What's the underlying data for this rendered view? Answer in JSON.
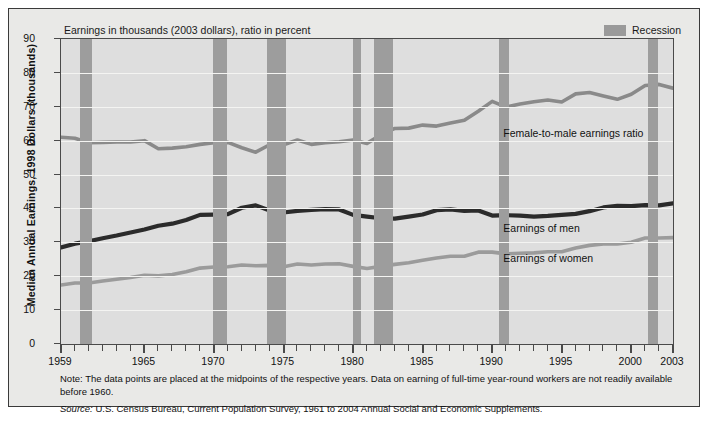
{
  "figure": {
    "units_caption": "Earnings in thousands (2003 dollars), ratio in percent",
    "y_axis_title": "Median Annual Earnings, 1998 Dollars (thousands)",
    "legend": {
      "swatch_name": "recession-swatch",
      "label": "Recession",
      "color": "#9d9d9d"
    },
    "notes": {
      "note": "Note: The data points are placed at the midpoints of the respective years. Data on earning of full-time year-round workers are not readily available before 1960.",
      "source_word": "Source:",
      "source_text": " U.S. Census Bureau, Current Population Survey, 1961 to 2004 Annual Social and Economic Supplements."
    }
  },
  "chart_data": {
    "type": "line",
    "title": "Earnings in thousands (2003 dollars), ratio in percent",
    "xlabel": "",
    "ylabel": "Median Annual Earnings, 1998 Dollars (thousands)",
    "xlim": [
      1959,
      2003
    ],
    "ylim": [
      0,
      90
    ],
    "yticks": [
      0,
      10,
      20,
      30,
      40,
      50,
      60,
      70,
      80,
      90
    ],
    "xticks": [
      1959,
      1965,
      1970,
      1975,
      1980,
      1985,
      1990,
      1995,
      2000,
      2003
    ],
    "grid": "horizontal",
    "legend_position": "top-right",
    "x": [
      1959,
      1960,
      1961,
      1962,
      1963,
      1964,
      1965,
      1966,
      1967,
      1968,
      1969,
      1970,
      1971,
      1972,
      1973,
      1974,
      1975,
      1976,
      1977,
      1978,
      1979,
      1980,
      1981,
      1982,
      1983,
      1984,
      1985,
      1986,
      1987,
      1988,
      1989,
      1990,
      1991,
      1992,
      1993,
      1994,
      1995,
      1996,
      1997,
      1998,
      1999,
      2000,
      2001,
      2002,
      2003
    ],
    "series": [
      {
        "name": "Female-to-male earnings ratio",
        "color": "#8a8a8a",
        "annotation": "Female-to-male earnings ratio",
        "unit": "percent",
        "values": [
          61.0,
          60.7,
          59.4,
          59.5,
          59.6,
          59.6,
          60.0,
          57.6,
          57.8,
          58.2,
          58.9,
          59.4,
          59.5,
          57.9,
          56.6,
          58.8,
          58.8,
          60.2,
          58.9,
          59.4,
          59.7,
          60.2,
          59.2,
          61.7,
          63.6,
          63.7,
          64.6,
          64.3,
          65.2,
          66.0,
          68.7,
          71.6,
          69.9,
          70.8,
          71.5,
          72.0,
          71.4,
          73.8,
          74.2,
          73.2,
          72.2,
          73.7,
          76.3,
          76.6,
          75.5
        ]
      },
      {
        "name": "Earnings of men",
        "color": "#2b2b2b",
        "annotation": "Earnings of men",
        "unit": "thousands of 2003 dollars",
        "values": [
          28.5,
          29.6,
          30.3,
          31.2,
          32.0,
          32.9,
          33.8,
          34.9,
          35.5,
          36.6,
          38.1,
          38.2,
          38.3,
          40.2,
          40.9,
          39.4,
          38.8,
          39.3,
          39.6,
          39.8,
          39.7,
          38.1,
          37.6,
          37.1,
          37.0,
          37.6,
          38.2,
          39.5,
          39.7,
          39.3,
          39.4,
          37.9,
          38.0,
          37.9,
          37.6,
          37.8,
          38.1,
          38.4,
          39.2,
          40.3,
          40.8,
          40.7,
          41.0,
          40.9,
          41.5
        ]
      },
      {
        "name": "Earnings of women",
        "color": "#9b9b9b",
        "annotation": "Earnings of women",
        "unit": "thousands of 2003 dollars",
        "values": [
          17.4,
          18.0,
          18.0,
          18.6,
          19.1,
          19.6,
          20.3,
          20.1,
          20.5,
          21.3,
          22.4,
          22.7,
          22.8,
          23.3,
          23.1,
          23.2,
          22.8,
          23.6,
          23.3,
          23.6,
          23.7,
          22.9,
          22.3,
          22.9,
          23.5,
          24.0,
          24.7,
          25.4,
          25.9,
          25.9,
          27.1,
          27.1,
          26.6,
          26.8,
          26.9,
          27.2,
          27.2,
          28.3,
          29.1,
          29.5,
          29.5,
          30.0,
          31.3,
          31.3,
          31.4
        ]
      }
    ],
    "recession_bands": [
      {
        "start": 1960.4,
        "end": 1961.2
      },
      {
        "start": 1969.9,
        "end": 1970.9
      },
      {
        "start": 1973.8,
        "end": 1975.2
      },
      {
        "start": 1980.0,
        "end": 1980.6
      },
      {
        "start": 1981.5,
        "end": 1982.9
      },
      {
        "start": 1990.5,
        "end": 1991.2
      },
      {
        "start": 2001.2,
        "end": 2001.9
      }
    ]
  }
}
